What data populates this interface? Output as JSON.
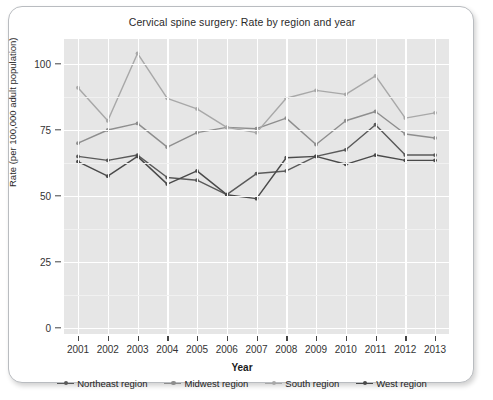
{
  "chart_data": {
    "type": "line",
    "title": "Cervical spine surgery: Rate by region and year",
    "xlabel": "Year",
    "ylabel": "Rate (per 100,000 adult population)",
    "categories": [
      "2001",
      "2002",
      "2003",
      "2004",
      "2005",
      "2006",
      "2007",
      "2008",
      "2009",
      "2010",
      "2011",
      "2012",
      "2013"
    ],
    "x": [
      2001,
      2002,
      2003,
      2004,
      2005,
      2006,
      2007,
      2008,
      2009,
      2010,
      2011,
      2012,
      2013
    ],
    "ylim": [
      0,
      110
    ],
    "yticks": [
      0,
      25,
      50,
      75,
      100
    ],
    "ytick_labels": [
      "0",
      "25",
      "50",
      "75",
      "100"
    ],
    "grid": true,
    "legend_position": "bottom",
    "series": [
      {
        "name": "Northeast region",
        "color": "#5a5a5a",
        "values": [
          65,
          63.5,
          65.5,
          57,
          56,
          50.5,
          58.5,
          59.5,
          65,
          67.5,
          77,
          65.5,
          65.5
        ]
      },
      {
        "name": "Midwest region",
        "color": "#8e8e8e",
        "values": [
          70,
          75,
          77.5,
          68.5,
          74,
          76,
          75.5,
          79.5,
          69.5,
          78.5,
          82,
          73.5,
          72
        ]
      },
      {
        "name": "South region",
        "color": "#a8a8a8",
        "values": [
          91,
          78.5,
          104,
          87,
          83,
          76,
          74,
          87,
          90,
          88.5,
          95.5,
          79.5,
          81.5
        ]
      },
      {
        "name": "West region",
        "color": "#4a4a4a",
        "values": [
          63,
          57.5,
          65,
          54.5,
          59.5,
          50.5,
          49,
          64.5,
          65,
          62,
          65.5,
          63.5,
          63.5
        ]
      }
    ]
  },
  "legend": {
    "items": [
      {
        "label": "Northeast region"
      },
      {
        "label": "Midwest region"
      },
      {
        "label": "South region"
      },
      {
        "label": "West region"
      }
    ]
  },
  "colors": {
    "panel_background": "#e6e6e6",
    "gridline": "#ffffff",
    "frame_border": "#b9bcc0",
    "page_background": "#ffffff"
  }
}
